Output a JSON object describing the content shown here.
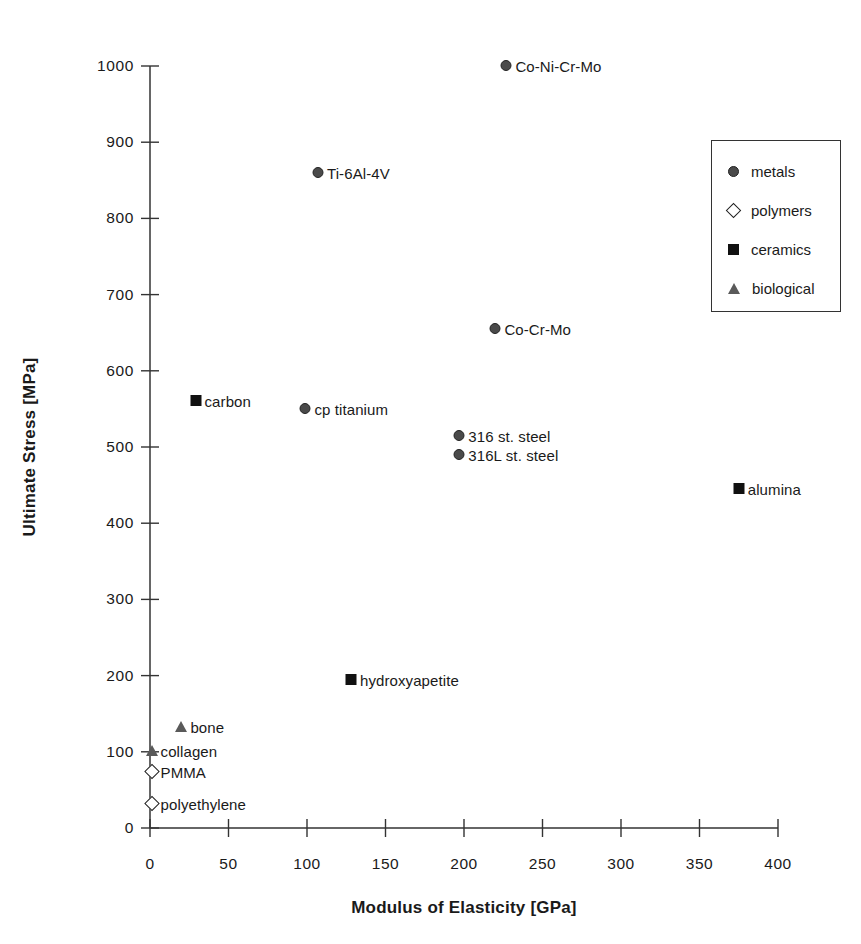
{
  "chart_data": {
    "type": "scatter",
    "title": "",
    "xlabel": "Modulus of Elasticity [GPa]",
    "ylabel": "Ultimate Stress [MPa]",
    "xlim": [
      0,
      400
    ],
    "ylim": [
      0,
      1000
    ],
    "xticks": [
      0,
      50,
      100,
      150,
      200,
      250,
      300,
      350,
      400
    ],
    "yticks": [
      0,
      100,
      200,
      300,
      400,
      500,
      600,
      700,
      800,
      900,
      1000
    ],
    "xtick_labels": [
      "0",
      "50",
      "100",
      "150",
      "200",
      "250",
      "300",
      "350",
      "400"
    ],
    "ytick_labels": [
      "0",
      "100",
      "200",
      "300",
      "400",
      "500",
      "600",
      "700",
      "800",
      "900",
      "1000"
    ],
    "grid": false,
    "legend_position": "upper right",
    "series": [
      {
        "name": "metals",
        "marker": "circle-filled-gray",
        "color": "#4a4a4a",
        "points": [
          {
            "label": "Co-Ni-Cr-Mo",
            "x": 227,
            "y": 1000
          },
          {
            "label": "Ti-6Al-4V",
            "x": 107,
            "y": 860
          },
          {
            "label": "Co-Cr-Mo",
            "x": 220,
            "y": 655
          },
          {
            "label": "cp titanium",
            "x": 99,
            "y": 550
          },
          {
            "label": "316 st. steel",
            "x": 197,
            "y": 515
          },
          {
            "label": "316L st. steel",
            "x": 197,
            "y": 490
          }
        ]
      },
      {
        "name": "polymers",
        "marker": "diamond-open",
        "color": "#ffffff",
        "points": [
          {
            "label": "PMMA",
            "x": 1,
            "y": 73
          },
          {
            "label": "polyethylene",
            "x": 1,
            "y": 32
          }
        ]
      },
      {
        "name": "ceramics",
        "marker": "square-filled-black",
        "color": "#111111",
        "points": [
          {
            "label": "carbon",
            "x": 29,
            "y": 560
          },
          {
            "label": "alumina",
            "x": 375,
            "y": 445
          },
          {
            "label": "hydroxyapetite",
            "x": 128,
            "y": 194
          }
        ]
      },
      {
        "name": "biological",
        "marker": "triangle-filled-gray",
        "color": "#5a5a5a",
        "points": [
          {
            "label": "bone",
            "x": 20,
            "y": 133
          },
          {
            "label": "collagen",
            "x": 1,
            "y": 101
          }
        ]
      }
    ],
    "legend_entries": [
      {
        "label": "metals",
        "marker": "circle-filled-gray"
      },
      {
        "label": "polymers",
        "marker": "diamond-open"
      },
      {
        "label": "ceramics",
        "marker": "square-filled-black"
      },
      {
        "label": "biological",
        "marker": "triangle-filled-gray"
      }
    ]
  },
  "colors": {
    "axis": "#333333",
    "text": "#1a1a1a",
    "metals": "#4a4a4a",
    "polymers": "#ffffff",
    "ceramics": "#111111",
    "biological": "#5a5a5a"
  }
}
